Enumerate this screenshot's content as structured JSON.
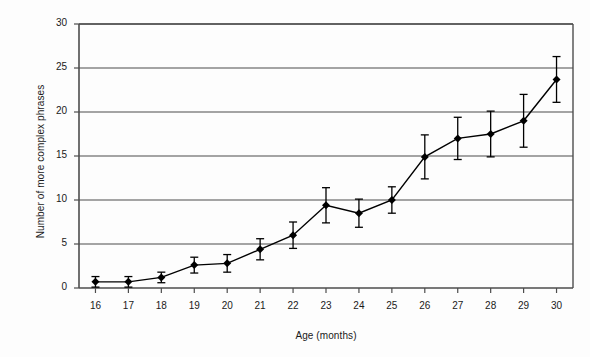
{
  "chart_data": {
    "type": "line",
    "title": "",
    "subtitle": "",
    "xlabel": "Age (months)",
    "ylabel": "Number of more complex phrases",
    "x": [
      16,
      17,
      18,
      19,
      20,
      21,
      22,
      23,
      24,
      25,
      26,
      27,
      28,
      29,
      30
    ],
    "xticklabels": [
      "16",
      "17",
      "18",
      "19",
      "20",
      "21",
      "22",
      "23",
      "24",
      "25",
      "26",
      "27",
      "28",
      "29",
      "30"
    ],
    "yticklabels": [
      "0",
      "5",
      "10",
      "15",
      "20",
      "25",
      "30"
    ],
    "yticks": [
      0,
      5,
      10,
      15,
      20,
      25,
      30
    ],
    "xlim": [
      15.5,
      30.5
    ],
    "ylim": [
      0,
      30
    ],
    "grid": "horizontal",
    "legend": "none",
    "series": [
      {
        "name": "Number of more complex phrases",
        "values": [
          0.7,
          0.7,
          1.2,
          2.6,
          2.8,
          4.4,
          6.0,
          9.4,
          8.5,
          10.0,
          14.9,
          17.0,
          17.5,
          19.0,
          23.7
        ],
        "err_low": [
          0.6,
          0.6,
          0.6,
          0.9,
          1.0,
          1.2,
          1.5,
          2.0,
          1.6,
          1.5,
          2.5,
          2.4,
          2.6,
          3.0,
          2.6
        ],
        "err_high": [
          0.6,
          0.6,
          0.6,
          0.9,
          1.0,
          1.2,
          1.5,
          2.0,
          1.6,
          1.5,
          2.5,
          2.4,
          2.6,
          3.0,
          2.6
        ],
        "marker": "diamond",
        "color": "#000000",
        "error_bars": true
      }
    ],
    "colors": {
      "line": "#000000",
      "marker": "#000000",
      "grid": "#4d4d4d",
      "axis": "#4d4d4d",
      "background": "#fdfdfd",
      "text": "#1a1a1a"
    }
  },
  "axes": {
    "x_title": "Age (months)",
    "y_title": "Number of more complex phrases"
  }
}
